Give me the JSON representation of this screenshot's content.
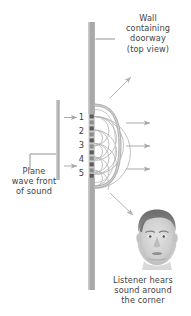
{
  "figure": {
    "title_alt": "Diffraction of plane sound waves through a doorway (top view)",
    "background_color": "#ffffff"
  },
  "labels": {
    "wall": "Wall\ncontaining\ndoorway\n(top view)",
    "plane_wave": "Plane\nwave front\nof sound",
    "listener": "Listener hears\nsound around\nthe corner"
  },
  "caption": {
    "text": ""
  },
  "sources": {
    "count": 5,
    "numbers": [
      "1",
      "2",
      "3",
      "4",
      "5"
    ],
    "description": "Huygens point sources in the doorway opening"
  },
  "colors": {
    "wall_gray": "#a9a9a9",
    "wall_gray_dark": "#8f8f8f",
    "plane_bar_gray": "#aeaeae",
    "wave_arc_gray": "#b8b8b8",
    "wavefront_gray": "#b0b0b0",
    "arrow_gray": "#a6a6a6",
    "dot_dark": "#4a4a4a",
    "text_gray": "#3f3f3f",
    "leader_gray": "#6f6f6f"
  },
  "elements": {
    "wall_top_segment": "upper wall section",
    "wall_bottom_segment": "lower wall section",
    "doorway_gap": "opening between wall segments",
    "plane_wave_bar": "incoming plane wave front",
    "incoming_arrows": 2,
    "outgoing_arrows": 3,
    "diffraction_arrows": 2,
    "listener_face": "head of listener, front view"
  }
}
